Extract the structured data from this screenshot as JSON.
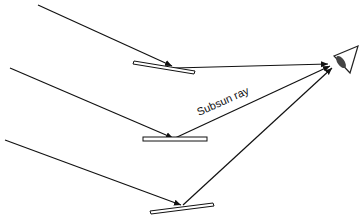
{
  "diagram": {
    "label": "Subsun ray",
    "colors": {
      "line": "#111111",
      "mirror_fill": "#ffffff",
      "eye": "#444444"
    }
  }
}
